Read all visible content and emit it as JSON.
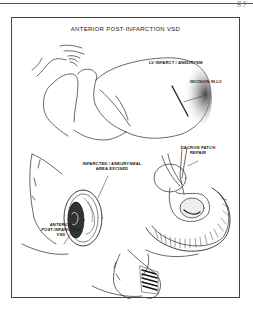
{
  "page": {
    "corner_mark": "g y"
  },
  "figure": {
    "title": "ANTERIOR POST-INFARCTION VSD",
    "labels": {
      "lv_infarct": "LV INFARCT / ANEURYSM",
      "incision": "INCISION IN LV",
      "excised_line1": "INFARCTED / ANEURYSMAL",
      "excised_line2": "AREA EXCISED",
      "dacron_line1": "DACRON PATCH",
      "dacron_line2": "REPAIR",
      "vsd_line1": "ANTERIOR",
      "vsd_line2": "POST-INFARCTION",
      "vsd_line3": "VSD"
    },
    "panels": [
      {
        "name": "heart-overview",
        "caption": "LV INFARCT / ANEURYSM"
      },
      {
        "name": "excision-view",
        "caption": "INFARCTED / ANEURYSMAL AREA EXCISED"
      },
      {
        "name": "patch-repair",
        "caption": "DACRON PATCH REPAIR"
      },
      {
        "name": "closure",
        "caption": ""
      }
    ],
    "colors": {
      "line": "#2a2a2a",
      "shade": "#555555",
      "frame": "#444444"
    }
  }
}
